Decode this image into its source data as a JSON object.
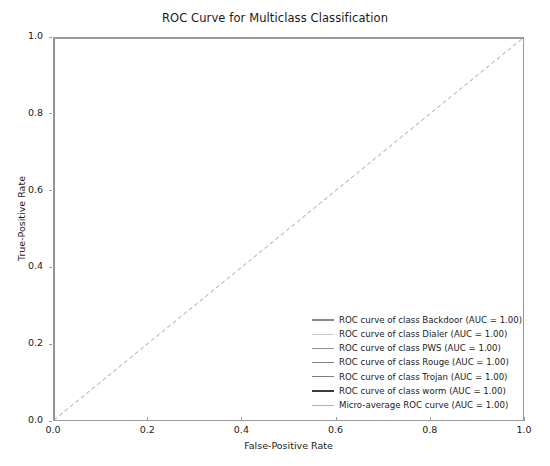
{
  "chart_data": {
    "type": "line",
    "title": "ROC Curve for Multiclass Classification",
    "xlabel": "False-Positive Rate",
    "ylabel": "True-Positive Rate",
    "xlim": [
      0.0,
      1.0
    ],
    "ylim": [
      0.0,
      1.0
    ],
    "xticks": [
      "0.0",
      "0.2",
      "0.4",
      "0.6",
      "0.8",
      "1.0"
    ],
    "xtick_values": [
      0.0,
      0.2,
      0.4,
      0.6,
      0.8,
      1.0
    ],
    "yticks": [
      "0.0",
      "0.2",
      "0.4",
      "0.6",
      "0.8",
      "1.0"
    ],
    "ytick_values": [
      0.0,
      0.2,
      0.4,
      0.6,
      0.8,
      1.0
    ],
    "grid": false,
    "legend_position": "lower right",
    "legend_frame": false,
    "series": [
      {
        "name": "ROC curve of class Backdoor (AUC = 1.00)",
        "class_name": "Backdoor",
        "auc": "1.00",
        "color": "#8a8a8a",
        "linestyle": "solid",
        "x": [
          0.0,
          0.0,
          1.0
        ],
        "y": [
          0.0,
          1.0,
          1.0
        ]
      },
      {
        "name": "ROC curve of class Dialer (AUC = 1.00)",
        "class_name": "Dialer",
        "auc": "1.00",
        "color": "#c8c8c8",
        "linestyle": "solid",
        "x": [
          0.0,
          0.0,
          1.0
        ],
        "y": [
          0.0,
          1.0,
          1.0
        ]
      },
      {
        "name": "ROC curve of class PWS (AUC = 1.00)",
        "class_name": "PWS",
        "auc": "1.00",
        "color": "#8f8f8f",
        "linestyle": "solid",
        "x": [
          0.0,
          0.0,
          1.0
        ],
        "y": [
          0.0,
          1.0,
          1.0
        ]
      },
      {
        "name": "ROC curve of class Rouge (AUC = 1.00)",
        "class_name": "Rouge",
        "auc": "1.00",
        "color": "#848484",
        "linestyle": "solid",
        "x": [
          0.0,
          0.0,
          1.0
        ],
        "y": [
          0.0,
          1.0,
          1.0
        ]
      },
      {
        "name": "ROC curve of class Trojan (AUC = 1.00)",
        "class_name": "Trojan",
        "auc": "1.00",
        "color": "#7d7d7d",
        "linestyle": "solid",
        "x": [
          0.0,
          0.0,
          1.0
        ],
        "y": [
          0.0,
          1.0,
          1.0
        ]
      },
      {
        "name": "ROC curve of class worm (AUC = 1.00)",
        "class_name": "worm",
        "auc": "1.00",
        "color": "#3c3c3c",
        "linestyle": "solid",
        "x": [
          0.0,
          0.0,
          1.0
        ],
        "y": [
          0.0,
          1.0,
          1.0
        ]
      },
      {
        "name": "Micro-average ROC curve (AUC = 1.00)",
        "class_name": "Micro-average",
        "auc": "1.00",
        "color": "#b0b0b0",
        "linestyle": "solid",
        "x": [
          0.0,
          0.0,
          1.0
        ],
        "y": [
          0.0,
          1.0,
          1.0
        ]
      }
    ],
    "reference_line": {
      "name": "chance-diagonal",
      "linestyle": "dashed",
      "color": "#9aa0b0",
      "x": [
        0.0,
        1.0
      ],
      "y": [
        0.0,
        1.0
      ]
    }
  }
}
